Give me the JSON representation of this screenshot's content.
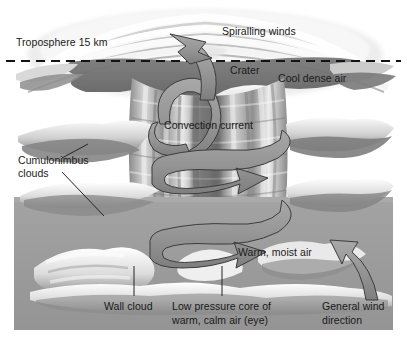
{
  "figure": {
    "background_color": "#ffffff",
    "sea_color": "#9a9a9a",
    "cloud_light_color": "#f2f2f2",
    "cloud_shadow_color": "#6f6f6f",
    "arrow_color": "#8c8c8c",
    "arrow_outline_color": "#3a3a3a",
    "text_color": "#1a1a1a",
    "leader_line_color": "#2a2a2a"
  },
  "labels": {
    "troposphere": "Troposphere 15 km",
    "spiralling_winds": "Spiralling winds",
    "crater": "Crater",
    "cool_dense_air": "Cool dense air",
    "convection_current": "Convection current",
    "cumulonimbus_line1": "Cumulonimbus",
    "cumulonimbus_line2": "clouds",
    "warm_moist_air": "Warm, moist air",
    "wall_cloud": "Wall cloud",
    "low_pressure_line1": "Low pressure core of",
    "low_pressure_line2": "warm, calm air (eye)",
    "general_wind_line1": "General wind",
    "general_wind_line2": "direction"
  }
}
